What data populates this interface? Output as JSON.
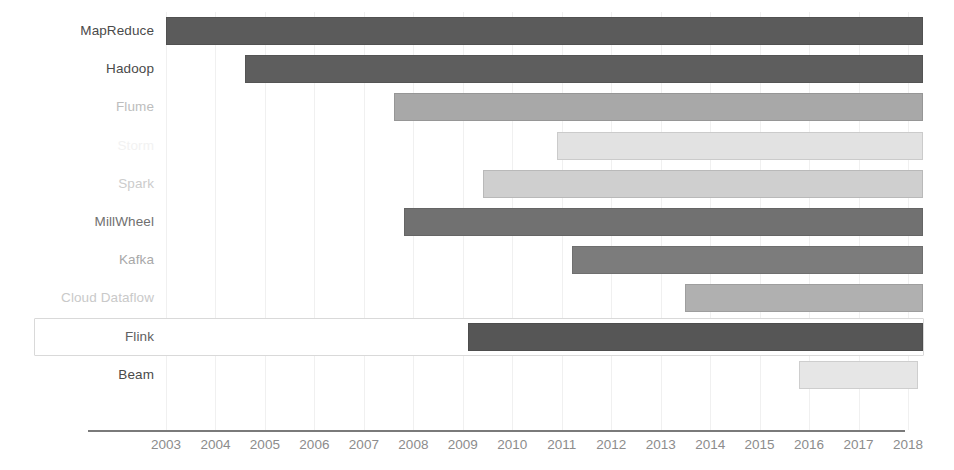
{
  "chart_data": {
    "type": "bar",
    "orientation": "horizontal",
    "subtype": "gantt-timeline",
    "title": "",
    "xlabel": "",
    "ylabel": "",
    "xlim": [
      2002.0,
      2018.6
    ],
    "grid": true,
    "legend": "none",
    "x_ticks": [
      2003,
      2004,
      2005,
      2006,
      2007,
      2008,
      2009,
      2010,
      2011,
      2012,
      2013,
      2014,
      2015,
      2016,
      2017,
      2018
    ],
    "x_tick_labels": [
      "2003",
      "2004",
      "2005",
      "2006",
      "2007",
      "2008",
      "2009",
      "2010",
      "2011",
      "2012",
      "2013",
      "2014",
      "2015",
      "2016",
      "2017",
      "2018"
    ],
    "categories": [
      "MapReduce",
      "Hadoop",
      "Flume",
      "Storm",
      "Spark",
      "MillWheel",
      "Kafka",
      "Cloud Dataflow",
      "Flink",
      "Beam"
    ],
    "bars": [
      {
        "label": "MapReduce",
        "start": 2003.0,
        "end": 2018.3,
        "color": "#5b5b5b",
        "label_color": "#4a4a4a",
        "highlighted": false
      },
      {
        "label": "Hadoop",
        "start": 2004.6,
        "end": 2018.3,
        "color": "#5e5e5e",
        "label_color": "#4a4a4a",
        "highlighted": false
      },
      {
        "label": "Flume",
        "start": 2007.6,
        "end": 2018.3,
        "color": "#a8a8a8",
        "label_color": "#bdbdbd",
        "highlighted": false
      },
      {
        "label": "Storm",
        "start": 2010.9,
        "end": 2018.3,
        "color": "#e2e2e2",
        "label_color": "#f2f2f2",
        "highlighted": false
      },
      {
        "label": "Spark",
        "start": 2009.4,
        "end": 2018.3,
        "color": "#cfcfcf",
        "label_color": "#cccccc",
        "highlighted": false
      },
      {
        "label": "MillWheel",
        "start": 2007.8,
        "end": 2018.3,
        "color": "#717171",
        "label_color": "#707070",
        "highlighted": false
      },
      {
        "label": "Kafka",
        "start": 2011.2,
        "end": 2018.3,
        "color": "#7c7c7c",
        "label_color": "#a8a8a8",
        "highlighted": false
      },
      {
        "label": "Cloud Dataflow",
        "start": 2013.5,
        "end": 2018.3,
        "color": "#b0b0b0",
        "label_color": "#c9c9c9",
        "highlighted": false
      },
      {
        "label": "Flink",
        "start": 2009.1,
        "end": 2018.3,
        "color": "#565656",
        "label_color": "#606060",
        "highlighted": true
      },
      {
        "label": "Beam",
        "start": 2015.8,
        "end": 2018.2,
        "color": "#e6e6e6",
        "label_color": "#4a4a4a",
        "highlighted": false
      }
    ]
  },
  "axis": {
    "tick_color": "#8c8c8c",
    "line_color": "#7a7a7a",
    "gridline_color": "#f0f0f0"
  },
  "highlight": {
    "border_color": "#d9d9d9",
    "target_label": "Flink"
  }
}
